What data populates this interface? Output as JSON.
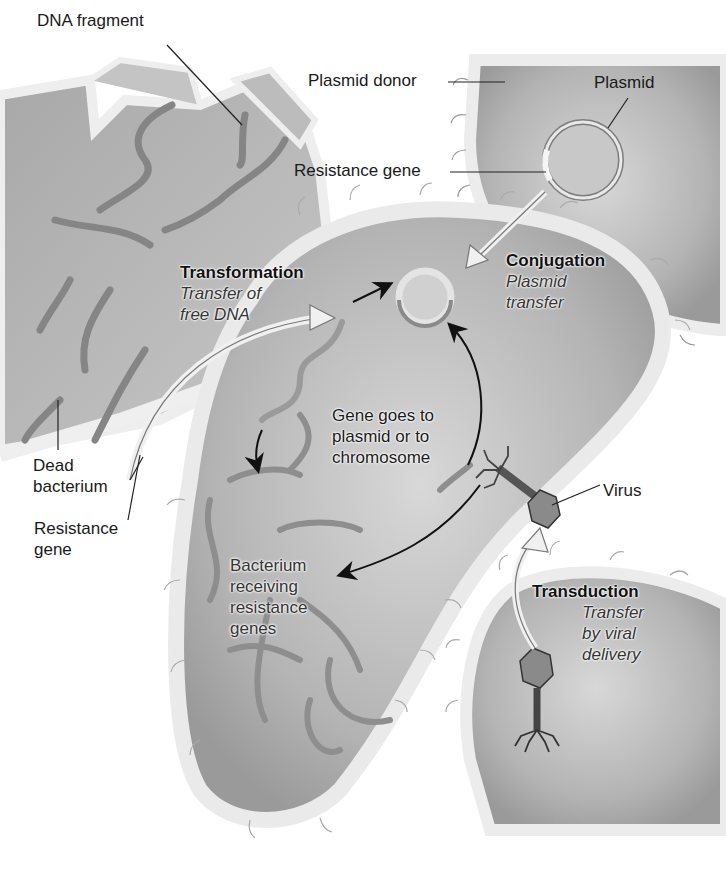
{
  "labels": {
    "dna_fragment": "DNA fragment",
    "plasmid_donor": "Plasmid donor",
    "plasmid": "Plasmid",
    "resistance_gene_top": "Resistance gene",
    "dead_bacterium": [
      "Dead",
      "bacterium"
    ],
    "resistance_gene_left": [
      "Resistance",
      "gene"
    ],
    "gene_goes_to": [
      "Gene goes to",
      "plasmid or to",
      "chromosome"
    ],
    "bacterium_receiving": [
      "Bacterium",
      "receiving",
      "resistance",
      "genes"
    ],
    "virus": "Virus"
  },
  "mechanisms": {
    "transformation": {
      "title": "Transformation",
      "desc": [
        "Transfer of",
        "free DNA"
      ]
    },
    "conjugation": {
      "title": "Conjugation",
      "desc": [
        "Plasmid",
        "transfer"
      ]
    },
    "transduction": {
      "title": "Transduction",
      "desc": [
        "Transfer",
        "by viral",
        "delivery"
      ]
    }
  },
  "colors": {
    "cell_fill": "#b8b8b8",
    "cell_wall": "#e6e6e6",
    "dna": "#8a8a8a",
    "arrow": "#111111",
    "background": "#ffffff"
  }
}
